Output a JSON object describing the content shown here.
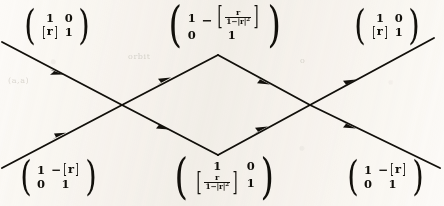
{
  "figure": {
    "kind": "commutative-diagram",
    "background_color": "#f7f5f2",
    "ink_color": "#16140f"
  },
  "nodes": [
    {
      "id": "top-left",
      "position": "top-left",
      "cells": [
        [
          "1",
          "0"
        ],
        [
          "[r]",
          "1"
        ]
      ],
      "a11": "1",
      "a12": "0",
      "a21_bracket_open": "[",
      "a21_symbol": "r",
      "a21_bracket_close": "]",
      "a22": "1",
      "left_paren": "(",
      "right_paren": ")"
    },
    {
      "id": "top-center",
      "position": "top-center",
      "a11": "1",
      "a12_minus": "−",
      "a12_bracket_open": "[",
      "a12_num": "r",
      "a12_den_one": "1",
      "a12_den_minus": "−",
      "a12_den_abs": "|r|",
      "a12_den_exp": "2",
      "a12_bracket_close": "]",
      "a21": "0",
      "a22": "1",
      "left_paren": "(",
      "right_paren": ")"
    },
    {
      "id": "top-right",
      "position": "top-right",
      "a11": "1",
      "a12": "0",
      "a21_bracket_open": "[",
      "a21_symbol": "r",
      "a21_bracket_close": "]",
      "a22": "1",
      "left_paren": "(",
      "right_paren": ")"
    },
    {
      "id": "bottom-left",
      "position": "bottom-left",
      "a11": "1",
      "a12_minus": "−",
      "a12_bracket_open": "[",
      "a12_symbol": "r",
      "a12_bracket_close": "]",
      "a21": "0",
      "a22": "1",
      "left_paren": "(",
      "right_paren": ")"
    },
    {
      "id": "bottom-center",
      "position": "bottom-center",
      "a11": "1",
      "a12": "0",
      "a21_bracket_open": "[",
      "a21_num": "r",
      "a21_den_one": "1",
      "a21_den_minus": "−",
      "a21_den_abs": "|r|",
      "a21_den_exp": "2",
      "a21_bracket_close": "]",
      "a22": "1",
      "left_paren": "(",
      "right_paren": ")"
    },
    {
      "id": "bottom-right",
      "position": "bottom-right",
      "a11": "1",
      "a12_minus": "−",
      "a12_bracket_open": "[",
      "a12_symbol": "r",
      "a12_bracket_close": "]",
      "a21": "0",
      "a22": "1",
      "left_paren": "(",
      "right_paren": ")"
    }
  ],
  "edges": [
    {
      "id": "edge-1",
      "from": "left-top-start",
      "to": "left-crossing",
      "direction": "down-right"
    },
    {
      "id": "edge-2",
      "from": "left-bottom-start",
      "to": "left-crossing",
      "direction": "up-right"
    },
    {
      "id": "edge-3",
      "from": "left-crossing",
      "to": "diamond-top",
      "direction": "up-right"
    },
    {
      "id": "edge-4",
      "from": "left-crossing",
      "to": "diamond-bottom",
      "direction": "down-right"
    },
    {
      "id": "edge-5",
      "from": "diamond-top",
      "to": "right-crossing",
      "direction": "down-right"
    },
    {
      "id": "edge-6",
      "from": "diamond-bottom",
      "to": "right-crossing",
      "direction": "up-right"
    },
    {
      "id": "edge-7",
      "from": "right-crossing",
      "to": "right-top-end",
      "direction": "up-right"
    },
    {
      "id": "edge-8",
      "from": "right-crossing",
      "to": "right-bottom-end",
      "direction": "down-right"
    }
  ],
  "ghost_text": [
    {
      "id": "ghost-1",
      "text": "orbit",
      "x": 128,
      "y": 56
    },
    {
      "id": "ghost-2",
      "text": "(a,a)",
      "x": 8,
      "y": 80
    },
    {
      "id": "ghost-3",
      "text": "o",
      "x": 300,
      "y": 60
    }
  ]
}
